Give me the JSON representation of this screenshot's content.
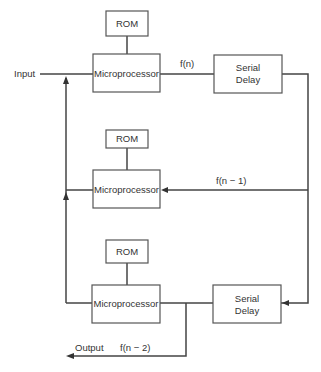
{
  "diagram": {
    "type": "block-diagram",
    "nodes": [
      {
        "id": "rom1",
        "label": "ROM"
      },
      {
        "id": "mp1",
        "label": "Microprocessor"
      },
      {
        "id": "delay1",
        "label_lines": [
          "Serial",
          "Delay"
        ]
      },
      {
        "id": "rom2",
        "label": "ROM"
      },
      {
        "id": "mp2",
        "label": "Microprocessor"
      },
      {
        "id": "rom3",
        "label": "ROM"
      },
      {
        "id": "mp3",
        "label": "Microprocessor"
      },
      {
        "id": "delay2",
        "label_lines": [
          "Serial",
          "Delay"
        ]
      }
    ],
    "edge_labels": {
      "input": "Input",
      "f_n": "f(n)",
      "f_n_minus_1": "f(n − 1)",
      "output": "Output",
      "f_n_minus_2": "f(n − 2)"
    },
    "edges": [
      {
        "from": "input",
        "to": "mp1"
      },
      {
        "from": "rom1",
        "to": "mp1"
      },
      {
        "from": "mp1",
        "to": "delay1",
        "label": "f(n)"
      },
      {
        "from": "delay1",
        "to": "mp2",
        "label": "f(n − 1)"
      },
      {
        "from": "delay1",
        "to": "delay2"
      },
      {
        "from": "rom2",
        "to": "mp2"
      },
      {
        "from": "mp2",
        "to": "input-bus"
      },
      {
        "from": "rom3",
        "to": "mp3"
      },
      {
        "from": "mp3",
        "to": "input-bus"
      },
      {
        "from": "mp3",
        "to": "delay2"
      },
      {
        "from": "mp3",
        "to": "output",
        "label": "f(n − 2)"
      }
    ]
  }
}
